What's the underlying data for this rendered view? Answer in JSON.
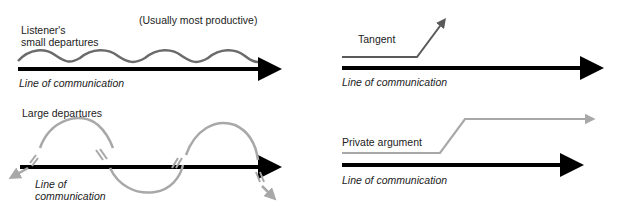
{
  "panels": {
    "small_departures": {
      "label_line1": "Listener's",
      "label_line2": "small departures",
      "note": "(Usually most productive)",
      "axis_label": "Line of communication",
      "curve_color": "#6b6b6b"
    },
    "tangent": {
      "label": "Tangent",
      "axis_label": "Line of communication",
      "curve_color": "#6b6b6b"
    },
    "large_departures": {
      "label": "Large departures",
      "axis_label_line1": "Line of",
      "axis_label_line2": "communication",
      "curve_color": "#a8a8a8"
    },
    "private_argument": {
      "label": "Private argument",
      "axis_label": "Line of communication",
      "curve_color": "#a8a8a8"
    }
  },
  "colors": {
    "axis": "#000000",
    "text": "#222222"
  }
}
